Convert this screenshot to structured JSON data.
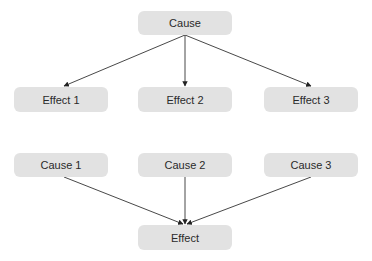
{
  "diagram": {
    "top": {
      "cause": {
        "label": "Cause"
      },
      "effects": [
        {
          "label": "Effect 1"
        },
        {
          "label": "Effect 2"
        },
        {
          "label": "Effect 3"
        }
      ]
    },
    "bottom": {
      "causes": [
        {
          "label": "Cause 1"
        },
        {
          "label": "Cause 2"
        },
        {
          "label": "Cause 3"
        }
      ],
      "effect": {
        "label": "Effect"
      }
    },
    "colors": {
      "node_fill": "#e2e2e2",
      "text": "#2a2a2a",
      "edge": "#333333"
    }
  }
}
